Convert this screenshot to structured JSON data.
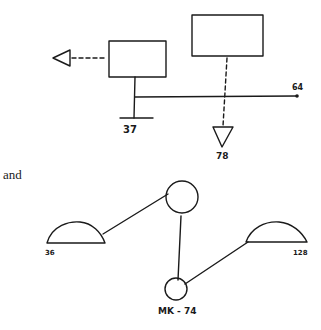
{
  "colors": {
    "ink": "#1a1a1a",
    "background": "#ffffff"
  },
  "diagram_top": {
    "nodes": [
      {
        "id": "left-box",
        "shape": "rectangle"
      },
      {
        "id": "right-box",
        "shape": "rectangle"
      },
      {
        "id": "left-triangle",
        "shape": "triangle-pointing-left"
      },
      {
        "id": "down-triangle",
        "shape": "triangle-pointing-down"
      },
      {
        "id": "ground-bar",
        "shape": "horizontal-bar"
      },
      {
        "id": "end-dot",
        "shape": "dot"
      }
    ],
    "labels": {
      "ground": "37",
      "line_end": "64",
      "down_triangle": "78"
    }
  },
  "connector_text": "and",
  "diagram_bottom": {
    "nodes": [
      {
        "id": "top-circle",
        "shape": "circle"
      },
      {
        "id": "bottom-circle",
        "shape": "circle"
      },
      {
        "id": "left-dome",
        "shape": "half-dome"
      },
      {
        "id": "right-dome",
        "shape": "half-dome"
      }
    ],
    "labels": {
      "left_dome": "36",
      "right_dome": "128",
      "bottom_circle": "MK - 74"
    }
  }
}
